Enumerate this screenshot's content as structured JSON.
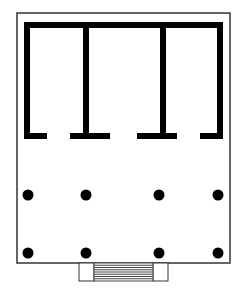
{
  "diagram": {
    "type": "architectural-floor-plan",
    "colors": {
      "background": "#ffffff",
      "wall": "#000000",
      "outline": "#333333",
      "stair_line": "#444444"
    },
    "platform_outline": {
      "x": 17,
      "y": 13,
      "width": 213,
      "height": 250
    },
    "cella_walls": {
      "thickness": 6,
      "top": {
        "x1": 24,
        "x2": 223,
        "y": 22
      },
      "left_wall_x": 24,
      "right_wall_x": 217,
      "bottom_y": 133,
      "partition_stems_x": [
        83,
        160
      ],
      "feet": [
        {
          "x": 24,
          "width": 23
        },
        {
          "x": 70,
          "width": 40
        },
        {
          "x": 137,
          "width": 40
        },
        {
          "x": 200,
          "width": 23
        }
      ]
    },
    "columns": {
      "radius": 5.5,
      "rows": [
        {
          "y": 195,
          "x": [
            28,
            86,
            159,
            218
          ]
        },
        {
          "y": 253,
          "x": [
            28,
            86,
            159,
            218
          ]
        }
      ]
    },
    "stairs": {
      "x": 79,
      "y": 263,
      "width": 89,
      "height": 18,
      "cheek_width": 15,
      "step_count": 8
    }
  }
}
